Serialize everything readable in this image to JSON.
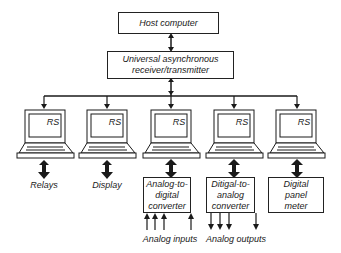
{
  "host": {
    "label": "Host computer"
  },
  "uart": {
    "line1": "Universal asynchronous",
    "line2": "receiver/transmitter"
  },
  "nodes": [
    {
      "screen_label": "RS",
      "output_label": "Relays"
    },
    {
      "screen_label": "RS",
      "output_label": "Display"
    },
    {
      "screen_label": "RS",
      "box_lines": [
        "Analog-to-",
        "digital",
        "converter"
      ],
      "io_label": "Analog inputs"
    },
    {
      "screen_label": "RS",
      "box_lines": [
        "Ditigal-to-",
        "analog",
        "converter"
      ],
      "io_label": "Analog outputs"
    },
    {
      "screen_label": "RS",
      "box_lines": [
        "Digital",
        "panel",
        "meter"
      ]
    }
  ]
}
